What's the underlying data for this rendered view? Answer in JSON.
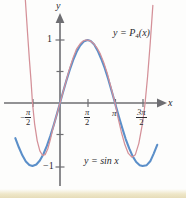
{
  "figure": {
    "axis_labels": {
      "x": "x",
      "y": "y"
    },
    "curve_labels": {
      "polynomial": "y = P₄(x)",
      "polynomial_lhs": "y =",
      "polynomial_name": "P",
      "polynomial_degree": "4",
      "polynomial_arg": "(x)",
      "sine": "y = sin x"
    },
    "y_tick_labels": {
      "positive_one": "1",
      "negative_one": "−1"
    },
    "x_tick_labels": {
      "neg_half_pi_sign": "−",
      "neg_half_pi_num": "π",
      "neg_half_pi_den": "2",
      "half_pi_num": "π",
      "half_pi_den": "2",
      "pi": "π",
      "three_half_pi_num": "3π",
      "three_half_pi_den": "2"
    },
    "colors": {
      "sine_curve": "#5b8fc9",
      "polynomial_curve": "#d49098",
      "axis": "#6e6e72",
      "text": "#2a2a2e",
      "background": "#fdfdfc",
      "bottom_band": "#efe7c9"
    }
  },
  "chart_data": {
    "type": "line",
    "title": "",
    "xlabel": "x",
    "ylabel": "y",
    "xlim": [
      -2.6,
      5.6
    ],
    "ylim": [
      -2.0,
      2.0
    ],
    "grid": false,
    "legend": "inline-annotations",
    "x_ticks": [
      -1.5707963,
      1.5707963,
      3.1415927,
      4.712389
    ],
    "x_tick_labels": [
      "−π/2",
      "π/2",
      "π",
      "3π/2"
    ],
    "y_ticks": [
      -1,
      1
    ],
    "y_tick_labels": [
      "−1",
      "1"
    ],
    "annotations": [
      {
        "text": "y = P₄(x)",
        "x": 3.6,
        "y": 1.45
      },
      {
        "text": "y = sin x",
        "x": 2.1,
        "y": -1.05
      }
    ],
    "series": [
      {
        "name": "y = sin x",
        "color": "#5b8fc9",
        "linewidth": 2.1,
        "x": [
          -2.55,
          -2.35,
          -2.15,
          -1.95,
          -1.75,
          -1.5708,
          -1.35,
          -1.15,
          -0.95,
          -0.75,
          -0.55,
          -0.35,
          -0.15,
          0,
          0.15,
          0.35,
          0.55,
          0.75,
          0.95,
          1.15,
          1.35,
          1.5708,
          1.75,
          1.95,
          2.15,
          2.35,
          2.55,
          2.75,
          2.95,
          3.1416,
          3.35,
          3.55,
          3.75,
          3.95,
          4.15,
          4.35,
          4.55,
          4.712,
          4.95,
          5.15,
          5.35,
          5.55
        ],
        "y": [
          -0.5576,
          -0.7027,
          -0.8309,
          -0.929,
          -0.9839,
          -1.0,
          -0.9757,
          -0.9128,
          -0.8134,
          -0.6816,
          -0.5227,
          -0.3429,
          -0.1494,
          0,
          0.1494,
          0.3429,
          0.5227,
          0.6816,
          0.8134,
          0.9128,
          0.9757,
          1.0,
          0.9839,
          0.929,
          0.8309,
          0.7027,
          0.5576,
          0.3817,
          0.1889,
          0,
          -0.2075,
          -0.3948,
          -0.5716,
          -0.7206,
          -0.8468,
          -0.9358,
          -0.9871,
          -1.0,
          -0.9866,
          -0.9257,
          -0.8027,
          -0.6636
        ]
      },
      {
        "name": "y = P₄(x)",
        "description": "fourth-degree Taylor polynomial of sin x about x = π/2 style approximation; plotted segment shown rising steeply outside [-π/2, 3π/2]",
        "color": "#d49098",
        "linewidth": 1.25,
        "x": [
          -2.05,
          -1.95,
          -1.85,
          -1.75,
          -1.65,
          -1.5708,
          -1.45,
          -1.3,
          -1.15,
          -1.0,
          -0.85,
          -0.7,
          -0.55,
          -0.4,
          -0.2,
          0,
          0.2,
          0.4,
          0.55,
          0.75,
          0.95,
          1.15,
          1.3,
          1.45,
          1.5708,
          1.7,
          1.9,
          2.1,
          2.3,
          2.5,
          2.7,
          2.9,
          3.1416,
          3.3,
          3.5,
          3.7,
          3.9,
          4.1,
          4.3,
          4.5,
          4.712,
          4.85,
          5.0,
          5.15,
          5.3
        ],
        "y": [
          1.95,
          1.52,
          1.1,
          0.7,
          0.34,
          0.0,
          -0.33,
          -0.6,
          -0.76,
          -0.83,
          -0.82,
          -0.73,
          -0.58,
          -0.4,
          -0.2,
          0.0,
          0.2,
          0.4,
          0.55,
          0.72,
          0.86,
          0.94,
          0.98,
          1.0,
          1.0,
          0.99,
          0.95,
          0.88,
          0.78,
          0.64,
          0.47,
          0.26,
          0.0,
          -0.22,
          -0.46,
          -0.66,
          -0.8,
          -0.86,
          -0.82,
          -0.64,
          -0.32,
          -0.02,
          0.42,
          0.95,
          1.55
        ]
      }
    ]
  }
}
